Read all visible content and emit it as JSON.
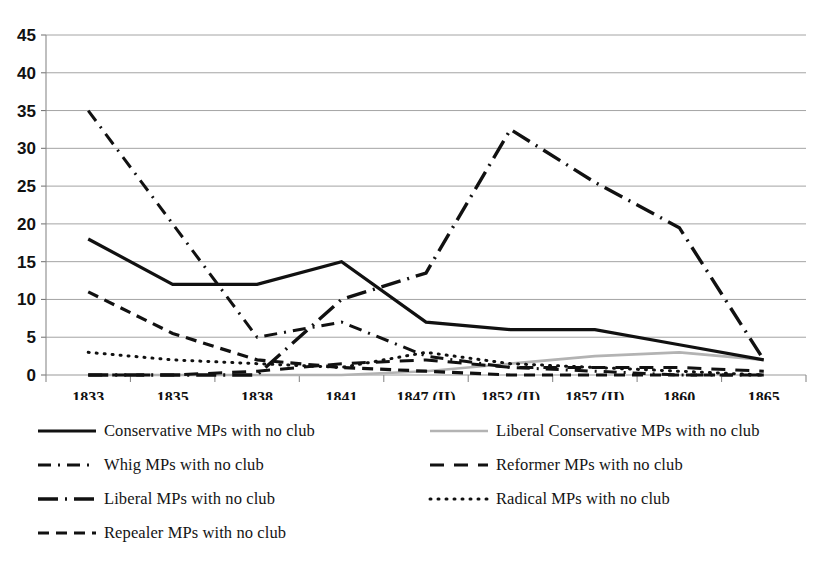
{
  "chart_data": {
    "type": "line",
    "title": "",
    "subtitle": "",
    "xlabel": "",
    "ylabel": "",
    "grid": true,
    "legend_position": "bottom",
    "ylim": [
      0,
      45
    ],
    "ytick_step": 5,
    "yticks": [
      "0",
      "5",
      "10",
      "15",
      "20",
      "25",
      "30",
      "35",
      "40",
      "45"
    ],
    "categories": [
      "1833",
      "1835",
      "1838",
      "1841",
      "1847 (II)",
      "1852 (II)",
      "1857 (II)",
      "1860",
      "1865"
    ],
    "series": [
      {
        "name": "Conservative MPs with no club",
        "style": "solid",
        "color": "#111111",
        "width": 3.2,
        "values": [
          18,
          12,
          12,
          15,
          7,
          6,
          6,
          4,
          2
        ]
      },
      {
        "name": "Liberal Conservative MPs with no club",
        "style": "solid",
        "color": "#b3b3b3",
        "width": 2.6,
        "values": [
          0,
          0,
          0,
          0,
          0.5,
          1.5,
          2.5,
          3,
          2
        ]
      },
      {
        "name": "Whig MPs with no club",
        "style": "dashdot",
        "color": "#111111",
        "width": 3.0,
        "values": [
          35,
          20,
          5,
          7,
          2.5,
          1,
          0.5,
          0,
          0
        ]
      },
      {
        "name": "Reformer MPs with no club",
        "style": "dash",
        "color": "#111111",
        "width": 3.0,
        "values": [
          0,
          0,
          0.5,
          1.5,
          2,
          1,
          1,
          1,
          0.5
        ]
      },
      {
        "name": "Liberal MPs with no club",
        "style": "longdashdot",
        "color": "#111111",
        "width": 3.4,
        "values": [
          0,
          0,
          0,
          10,
          13.5,
          32.5,
          25.5,
          19.5,
          2
        ]
      },
      {
        "name": "Radical MPs with no club",
        "style": "dot",
        "color": "#111111",
        "width": 3.0,
        "values": [
          3,
          2,
          1.5,
          1,
          3,
          1.5,
          1,
          0.5,
          0
        ]
      },
      {
        "name": "Repealer MPs with no club",
        "style": "shortdash",
        "color": "#111111",
        "width": 3.2,
        "values": [
          11,
          5.5,
          2,
          1,
          0.5,
          0,
          0,
          0,
          0
        ]
      }
    ]
  },
  "legend": {
    "left_column": [
      {
        "label": "Conservative MPs with no club",
        "swatch": "solid-line-swatch",
        "color": "#111111"
      },
      {
        "label": "Whig MPs with no club",
        "swatch": "dashdot-line-swatch",
        "color": "#111111"
      },
      {
        "label": "Liberal MPs with no club",
        "swatch": "longdashdot-line-swatch",
        "color": "#111111"
      },
      {
        "label": "Repealer MPs with no club",
        "swatch": "shortdash-line-swatch",
        "color": "#111111"
      }
    ],
    "right_column": [
      {
        "label": "Liberal Conservative MPs with no club",
        "swatch": "solid-gray-line-swatch",
        "color": "#b3b3b3"
      },
      {
        "label": "Reformer MPs with no club",
        "swatch": "dash-line-swatch",
        "color": "#111111"
      },
      {
        "label": "Radical MPs with no club",
        "swatch": "dot-line-swatch",
        "color": "#111111"
      }
    ]
  }
}
